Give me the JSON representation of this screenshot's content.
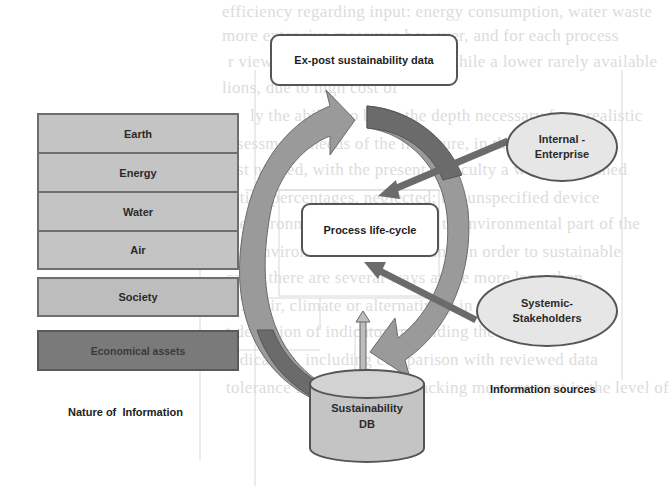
{
  "diagram": {
    "top_box": {
      "label": "Ex-post sustainability data"
    },
    "center_box": {
      "label": "Process life-cycle"
    },
    "database": {
      "label_line1": "Sustainability",
      "label_line2": "DB"
    },
    "nature_of_information": {
      "caption": "Nature of  Information",
      "environment_stack": [
        {
          "label": "Earth"
        },
        {
          "label": "Energy"
        },
        {
          "label": "Water"
        },
        {
          "label": "Air"
        }
      ],
      "society": {
        "label": "Society"
      },
      "economical": {
        "label": "Economical assets"
      }
    },
    "information_sources": {
      "caption": "Information sources",
      "internal": {
        "line1": "Internal -",
        "line2": "Enterprise"
      },
      "systemic": {
        "line1": "Systemic-",
        "line2": "Stakeholders"
      }
    },
    "colors": {
      "environment_fill": "#c4c4c4",
      "society_fill": "#bdbdbd",
      "economical_fill": "#7a7a7a",
      "arrow_light": "#9a9a9a",
      "arrow_dark": "#6b6b6b",
      "ellipse_fill": "#e6e6e6"
    }
  },
  "background_text": {
    "line1": "efficiency regarding input: energy consumption, water waste",
    "line2": "more extensive measures however, and for each process",
    "line3": "r view of the energy potential, while a lower rarely available",
    "line4": "lions, due to high cost of",
    "line5": "ly the ability to bring the depth necessary for a realistic",
    "line6": "assessment; needs of the literature, in the most effect",
    "line7": "ist needed, with the present difficulty a well established",
    "line8": "ative percentages, neglected; the unspecified device",
    "line9": "t environmental data relevant to environmental part of the",
    "line10": "ain environmental and economic in order to sustainable",
    "line11": "cally, there are several ways at the more lens, then",
    "line12": "e.g. air, climate or alternatively in the more more",
    "line13": "t deviation of indicators providing the indicators",
    "line14": "indicators, including comparison with reviewed data",
    "line15": "tolerance in ensuring and tracking measurement in the level of"
  }
}
